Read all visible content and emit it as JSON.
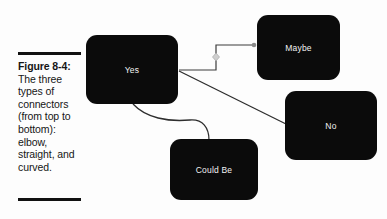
{
  "figure": {
    "label": "Figure 8-4:",
    "body": "The three types of connectors (from top to bottom): elbow, straight, and curved.",
    "rule_color": "#111111"
  },
  "diagram": {
    "background": "#fdfdfd",
    "node_fill": "#0b0b0b",
    "node_text_color": "#f2f2f2",
    "connector_color": "#3d3d3d",
    "handle_color": "#b6b6b6",
    "nodes": [
      {
        "id": "yes",
        "label": "Yes"
      },
      {
        "id": "maybe",
        "label": "Maybe"
      },
      {
        "id": "no",
        "label": "No"
      },
      {
        "id": "could-be",
        "label": "Could Be"
      }
    ],
    "connectors": [
      {
        "id": "elbow",
        "type": "elbow",
        "from": "yes",
        "to": "maybe"
      },
      {
        "id": "straight",
        "type": "straight",
        "from": "yes",
        "to": "no"
      },
      {
        "id": "curved",
        "type": "curved",
        "from": "yes",
        "to": "could-be"
      }
    ]
  }
}
